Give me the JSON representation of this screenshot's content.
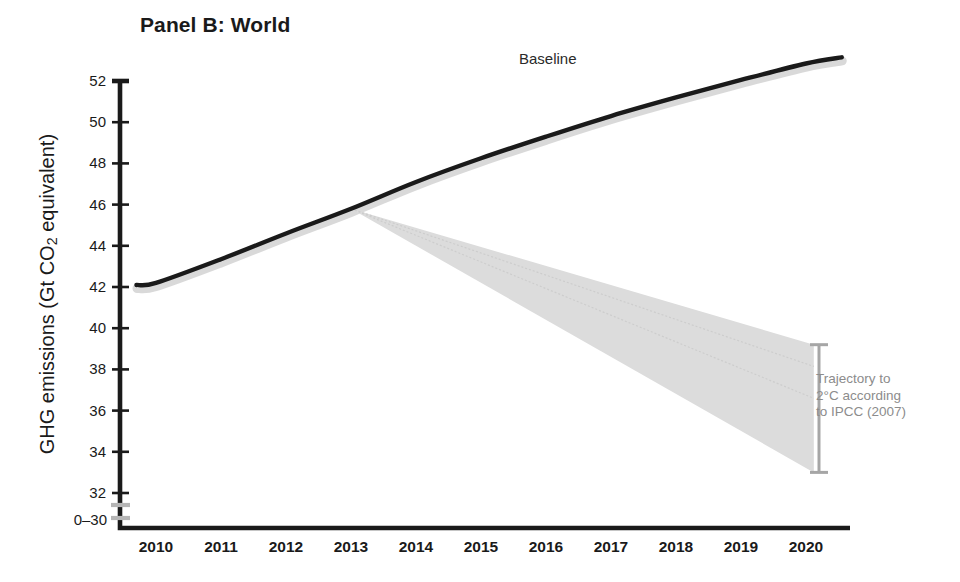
{
  "figure": {
    "panel_title": "Panel B: World",
    "y_axis_title_prefix": "GHG emissions (Gt CO",
    "y_axis_title_sub": "2",
    "y_axis_title_suffix": " equivalent)",
    "break_label": "0–30",
    "baseline_label": "Baseline",
    "annotation_line1": "Trajectory to",
    "annotation_line2": "2°C according",
    "annotation_line3": "to IPCC (2007)"
  },
  "colors": {
    "line": "#1a1a1a",
    "wedge_fill": "#dcdcdc",
    "wedge_shadow": "#cfcfcf",
    "bracket": "#a6a6a6",
    "axis": "#1a1a1a",
    "break_mark": "#b5b5b5",
    "annotation_text": "#8c8c8c",
    "background": "#ffffff"
  },
  "chart_data": {
    "type": "line",
    "title": "Panel B: World",
    "xlabel": "",
    "ylabel": "GHG emissions (Gt CO2 equivalent)",
    "xlim": [
      2009.6,
      2020.6
    ],
    "ylim": [
      30,
      52.8
    ],
    "y_axis_break": "0–30",
    "grid": false,
    "legend": "inline-annotations",
    "x_tick_labels": [
      "2010",
      "2011",
      "2012",
      "2013",
      "2014",
      "2015",
      "2016",
      "2017",
      "2018",
      "2019",
      "2020"
    ],
    "y_tick_labels": [
      "32",
      "34",
      "36",
      "38",
      "40",
      "42",
      "44",
      "46",
      "48",
      "50",
      "52"
    ],
    "y_ticks": [
      32,
      34,
      36,
      38,
      40,
      42,
      44,
      46,
      48,
      50,
      52
    ],
    "x": [
      2009.7,
      2010,
      2011,
      2012,
      2013,
      2014,
      2015,
      2016,
      2017,
      2018,
      2019,
      2020,
      2020.55
    ],
    "series": [
      {
        "name": "Baseline",
        "label_position": {
          "x": 2016.2,
          "y": 53.0
        },
        "values": [
          42.1,
          42.2,
          43.35,
          44.6,
          45.8,
          47.1,
          48.25,
          49.3,
          50.3,
          51.2,
          52.05,
          52.85,
          53.15
        ]
      }
    ],
    "wedge": {
      "name": "Trajectory to 2°C according to IPCC (2007)",
      "apex": {
        "x": 2013,
        "y": 45.8
      },
      "upper_end": {
        "x": 2020.12,
        "y": 39.2
      },
      "lower_end": {
        "x": 2020.12,
        "y": 33.0
      },
      "fill": "#dcdcdc"
    },
    "bracket": {
      "x": 2020.2,
      "y_top": 39.2,
      "y_bottom": 33.0,
      "color": "#a6a6a6",
      "annotation": [
        "Trajectory to",
        "2°C according",
        "to IPCC (2007)"
      ]
    }
  }
}
